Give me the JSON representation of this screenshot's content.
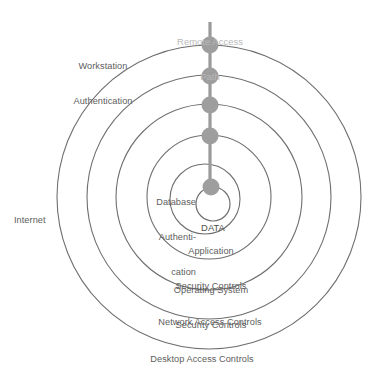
{
  "diagram": {
    "type": "concentric-rings",
    "colors": {
      "ring_stroke": "#6f6f6f",
      "label_text": "#5d5d5d",
      "path_line": "#9a9a9a",
      "path_node": "#9e9e9e",
      "remote_path_text": "#b9b9b9",
      "background": "#ffffff"
    },
    "center_label": "DATA",
    "outside_labels": [
      {
        "name": "workstation-authentication",
        "lines": [
          "Workstation",
          "Authentication"
        ]
      },
      {
        "name": "internet",
        "lines": [
          "Internet"
        ]
      },
      {
        "name": "remote-access-path",
        "lines": [
          "Remote Access",
          "Path"
        ]
      }
    ],
    "rings": [
      {
        "index": 1,
        "name": "desktop-access-controls",
        "lines": [
          "Desktop Access Controls"
        ]
      },
      {
        "index": 2,
        "name": "network-access-controls",
        "lines": [
          "Network Access Controls"
        ]
      },
      {
        "index": 3,
        "name": "operating-system-security-controls",
        "lines": [
          "Operating System",
          "Security Controls"
        ]
      },
      {
        "index": 4,
        "name": "application-security-controls",
        "lines": [
          "Application",
          "Security Controls"
        ]
      },
      {
        "index": 5,
        "name": "database-authentication",
        "lines": [
          "Database",
          "Authenti-",
          "cation"
        ]
      }
    ],
    "path": {
      "name": "remote-access-path",
      "label_lines": [
        "Remote Access",
        "Path"
      ],
      "node_count": 5
    },
    "labels": {
      "workstation_line1": "Workstation",
      "workstation_line2": "Authentication",
      "internet": "Internet",
      "remote_line1": "Remote Access",
      "remote_line2": "Path",
      "database_line1": "Database",
      "database_line2": "Authenti-",
      "database_line3": "cation",
      "data": "DATA",
      "application_line1": "Application",
      "application_line2": "Security Controls",
      "os_line1": "Operating System",
      "os_line2": "Security Controls",
      "network": "Network Access Controls",
      "desktop": "Desktop Access Controls"
    }
  }
}
